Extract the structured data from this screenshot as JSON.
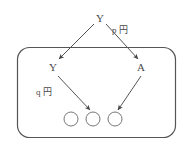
{
  "diagram": {
    "type": "flow-arrow-diagram",
    "background_color": "#ffffff",
    "stroke_color": "#555555",
    "text_color": "#4a4a4a",
    "container": {
      "shape": "rounded-rectangle",
      "label": ""
    },
    "nodes": [
      {
        "id": "top",
        "label": "Y",
        "x": 99,
        "y": 18
      },
      {
        "id": "left",
        "label": "Y",
        "x": 52,
        "y": 68
      },
      {
        "id": "right",
        "label": "A",
        "x": 140,
        "y": 68
      }
    ],
    "edge_labels": [
      {
        "id": "p-yen",
        "label": "p 円",
        "x": 118,
        "y": 31
      },
      {
        "id": "q-yen",
        "label": "q 円",
        "x": 41,
        "y": 93
      }
    ],
    "circles": [
      {
        "id": "circle-1",
        "cx": 71,
        "cy": 119,
        "r": 7
      },
      {
        "id": "circle-2",
        "cx": 93,
        "cy": 119,
        "r": 7
      },
      {
        "id": "circle-3",
        "cx": 115,
        "cy": 119,
        "r": 7
      }
    ]
  }
}
